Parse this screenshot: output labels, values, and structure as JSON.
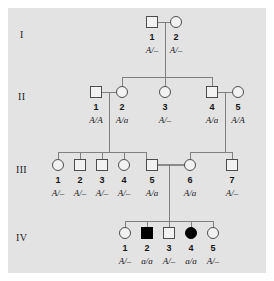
{
  "figure": {
    "type": "pedigree-chart",
    "title": "",
    "background_color": "#e3e3e3",
    "symbol_outline_color": "#4d4d4d",
    "line_color": "#808080",
    "affected_fill_color": "#000000",
    "unaffected_fill_color": "#f2f2f2"
  },
  "generations": [
    {
      "label": "I"
    },
    {
      "label": "II"
    },
    {
      "label": "III"
    },
    {
      "label": "IV"
    }
  ],
  "individuals": [
    {
      "gen": "I",
      "num": "1",
      "sex": "male",
      "affected": false,
      "genotype": "A/–"
    },
    {
      "gen": "I",
      "num": "2",
      "sex": "female",
      "affected": false,
      "genotype": "A/–"
    },
    {
      "gen": "II",
      "num": "1",
      "sex": "male",
      "affected": false,
      "genotype": "A/A"
    },
    {
      "gen": "II",
      "num": "2",
      "sex": "female",
      "affected": false,
      "genotype": "A/a"
    },
    {
      "gen": "II",
      "num": "3",
      "sex": "female",
      "affected": false,
      "genotype": "A/–"
    },
    {
      "gen": "II",
      "num": "4",
      "sex": "male",
      "affected": false,
      "genotype": "A/a"
    },
    {
      "gen": "II",
      "num": "5",
      "sex": "female",
      "affected": false,
      "genotype": "A/A"
    },
    {
      "gen": "III",
      "num": "1",
      "sex": "female",
      "affected": false,
      "genotype": "A/–"
    },
    {
      "gen": "III",
      "num": "2",
      "sex": "male",
      "affected": false,
      "genotype": "A/–"
    },
    {
      "gen": "III",
      "num": "3",
      "sex": "male",
      "affected": false,
      "genotype": "A/–"
    },
    {
      "gen": "III",
      "num": "4",
      "sex": "female",
      "affected": false,
      "genotype": "A/–"
    },
    {
      "gen": "III",
      "num": "5",
      "sex": "male",
      "affected": false,
      "genotype": "A/a"
    },
    {
      "gen": "III",
      "num": "6",
      "sex": "female",
      "affected": false,
      "genotype": "A/a"
    },
    {
      "gen": "III",
      "num": "7",
      "sex": "male",
      "affected": false,
      "genotype": "A/–"
    },
    {
      "gen": "IV",
      "num": "1",
      "sex": "female",
      "affected": false,
      "genotype": "A/–"
    },
    {
      "gen": "IV",
      "num": "2",
      "sex": "male",
      "affected": true,
      "genotype": "a/a"
    },
    {
      "gen": "IV",
      "num": "3",
      "sex": "male",
      "affected": false,
      "genotype": "A/–"
    },
    {
      "gen": "IV",
      "num": "4",
      "sex": "female",
      "affected": true,
      "genotype": "a/a"
    },
    {
      "gen": "IV",
      "num": "5",
      "sex": "female",
      "affected": false,
      "genotype": "A/–"
    }
  ],
  "gen1": {
    "label": "I",
    "p1": {
      "num": "1",
      "genotype": "A/–"
    },
    "p2": {
      "num": "2",
      "genotype": "A/–"
    }
  },
  "gen2": {
    "label": "II",
    "p1": {
      "num": "1",
      "genotype": "A/A"
    },
    "p2": {
      "num": "2",
      "genotype": "A/a"
    },
    "p3": {
      "num": "3",
      "genotype": "A/–"
    },
    "p4": {
      "num": "4",
      "genotype": "A/a"
    },
    "p5": {
      "num": "5",
      "genotype": "A/A"
    }
  },
  "gen3": {
    "label": "III",
    "p1": {
      "num": "1",
      "genotype": "A/–"
    },
    "p2": {
      "num": "2",
      "genotype": "A/–"
    },
    "p3": {
      "num": "3",
      "genotype": "A/–"
    },
    "p4": {
      "num": "4",
      "genotype": "A/–"
    },
    "p5": {
      "num": "5",
      "genotype": "A/a"
    },
    "p6": {
      "num": "6",
      "genotype": "A/a"
    },
    "p7": {
      "num": "7",
      "genotype": "A/–"
    }
  },
  "gen4": {
    "label": "IV",
    "p1": {
      "num": "1",
      "genotype": "A/–"
    },
    "p2": {
      "num": "2",
      "genotype": "a/a"
    },
    "p3": {
      "num": "3",
      "genotype": "A/–"
    },
    "p4": {
      "num": "4",
      "genotype": "a/a"
    },
    "p5": {
      "num": "5",
      "genotype": "A/–"
    }
  }
}
